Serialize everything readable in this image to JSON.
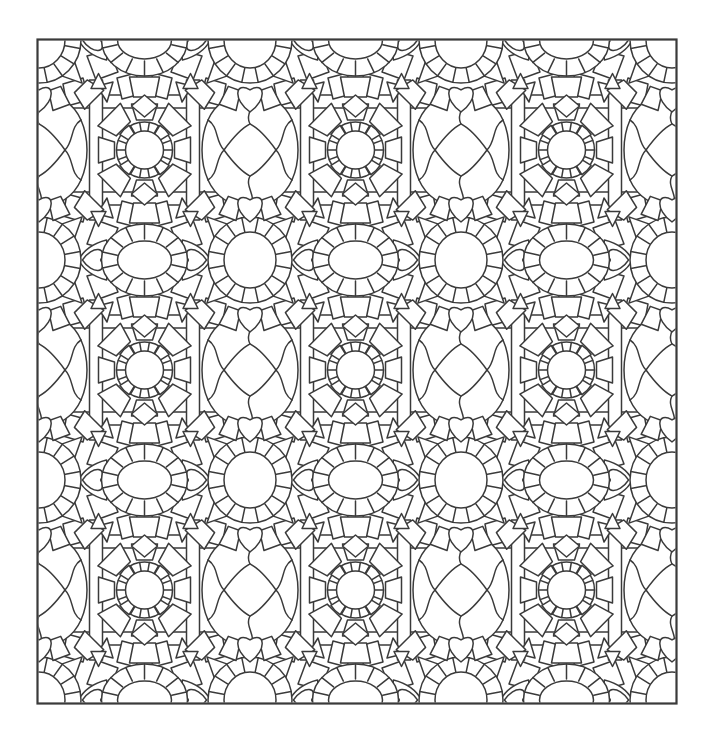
{
  "meta": {
    "domain": "coloring-page-pattern"
  },
  "canvas": {
    "width": 714,
    "height": 733,
    "background": "#ffffff",
    "line_color": "#3a3a3a",
    "line_width": 1.5
  },
  "border": {
    "x": 37.5,
    "y": 39.5,
    "width": 639,
    "height": 664,
    "stroke_width": 2.2
  },
  "tile": {
    "width": 211,
    "height": 220,
    "origin_x": 39,
    "origin_y": 40
  },
  "motifs": {
    "bars": {
      "thickness": 13,
      "inner_offset": 42,
      "vertical_span": [
        40,
        180
      ]
    },
    "gear_medallion": {
      "ring_outer_r": 28,
      "ring_inner_r": 19,
      "tick_count": 18,
      "hook_angles": [
        45,
        135,
        225,
        315
      ],
      "wedge_inner_r": 30,
      "wedge_outer_r_cardinal": 46,
      "wedge_outer_r_diagonal": 50,
      "wedge_count": 8,
      "foot_offset": 57,
      "foot_rotations": {
        "-1,-1": 135,
        "1,-1": -135,
        "1,1": -45,
        "-1,1": 45
      },
      "corner_triangle_offset": [
        46,
        69
      ]
    },
    "eye_medallion": {
      "ring_rx": 43,
      "ring_ry": 36,
      "petal_count": 14,
      "eye_rx": 27,
      "eye_ry": 19,
      "leaf_base": 38,
      "leaf_tip": 66,
      "leaf_half_height": 20,
      "leaf_heart_w": 26,
      "leaf_heart_h": 28,
      "leaf_heart_x": 48,
      "keystone_offset": 47,
      "rhombus_offset": 66
    },
    "sun_medallion": {
      "ring_outer_rx": 42,
      "ring_outer_ry": 43,
      "ring_inner_rx": 26,
      "ring_inner_ry": 28,
      "tick_count": 16,
      "ray_base_r": 40,
      "ray_tip_r": 61,
      "ray_base_halfwidth": 10,
      "ray_angles": [
        45,
        135,
        225,
        315
      ]
    },
    "lattice": {
      "half_width": 45,
      "half_height": 58,
      "diamond_r": 26
    },
    "heart": {
      "width": 30,
      "height": 34,
      "column_offset_y": 55
    },
    "flag": {
      "dx": 19,
      "dy": 3,
      "rotation": 20
    }
  },
  "motif_names": [
    "gear-circle-medallion",
    "square-bar-frame",
    "oval-eye-medallion",
    "leaf-point",
    "heart-ornament",
    "sunburst-rosette",
    "wavy-lattice-diamond",
    "corner-foot-block",
    "arrow-triangle",
    "keystone-wedge",
    "filler-stone",
    "border-frame"
  ]
}
